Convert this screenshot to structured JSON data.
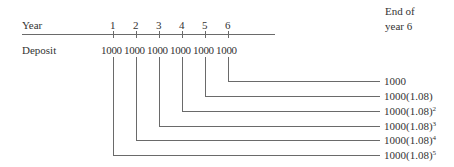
{
  "row_labels": {
    "year": "Year",
    "deposit": "Deposit"
  },
  "end_label": {
    "line1": "End of",
    "line2": "year 6"
  },
  "years": [
    "1",
    "2",
    "3",
    "4",
    "5",
    "6"
  ],
  "deposits": [
    "1000",
    "1000",
    "1000",
    "1000",
    "1000",
    "1000"
  ],
  "results": [
    {
      "base": "1000",
      "exp": ""
    },
    {
      "base": "1000(1.08)",
      "exp": ""
    },
    {
      "base": "1000(1.08)",
      "exp": "2"
    },
    {
      "base": "1000(1.08)",
      "exp": "3"
    },
    {
      "base": "1000(1.08)",
      "exp": "4"
    },
    {
      "base": "1000(1.08)",
      "exp": "5"
    }
  ],
  "colors": {
    "line": "#6a6a6a",
    "text": "#333333"
  }
}
